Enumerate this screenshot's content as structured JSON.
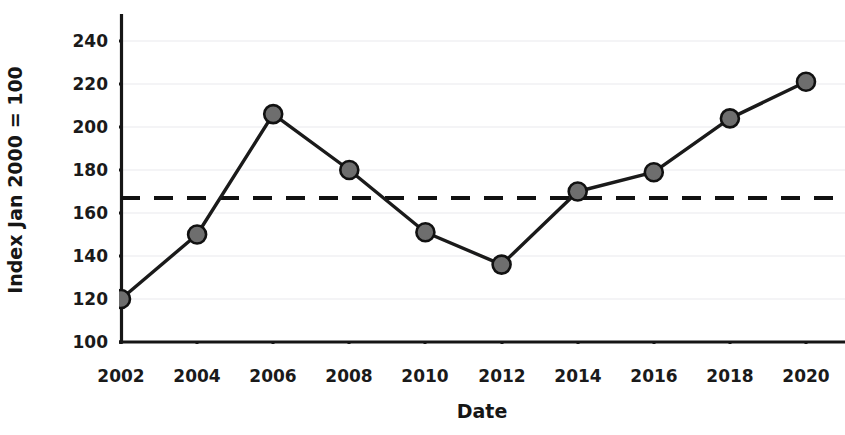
{
  "chart_data": {
    "type": "line",
    "title": "",
    "xlabel": "Date",
    "ylabel": "Index Jan 2000 = 100",
    "x": [
      2002,
      2004,
      2006,
      2008,
      2010,
      2012,
      2014,
      2016,
      2018,
      2020
    ],
    "values": [
      120,
      150,
      206,
      180,
      151,
      136,
      170,
      179,
      204,
      221
    ],
    "series": [
      {
        "name": "Index",
        "values": [
          120,
          150,
          206,
          180,
          151,
          136,
          170,
          179,
          204,
          221
        ]
      }
    ],
    "xtick_labels": [
      "2002",
      "2004",
      "2006",
      "2008",
      "2010",
      "2012",
      "2014",
      "2016",
      "2018",
      "2020"
    ],
    "ytick_labels": [
      "100",
      "120",
      "140",
      "160",
      "180",
      "200",
      "220",
      "240"
    ],
    "yticks": [
      100,
      120,
      140,
      160,
      180,
      200,
      220,
      240
    ],
    "xlim": [
      2001,
      2021
    ],
    "ylim": [
      100,
      248
    ],
    "grid": "horizontal-faint",
    "legend": "none",
    "annotations": [
      {
        "type": "horizontal-reference-line",
        "value": 167,
        "style": "dashed",
        "label": ""
      }
    ],
    "colors": {
      "line": "#1a1a1a",
      "marker_fill": "#6e6e6e",
      "marker_edge": "#111111",
      "axis": "#161616",
      "grid": "#f2f2f4",
      "reference_line": "#111111",
      "background": "#ffffff",
      "text": "#1a1a1a"
    }
  }
}
